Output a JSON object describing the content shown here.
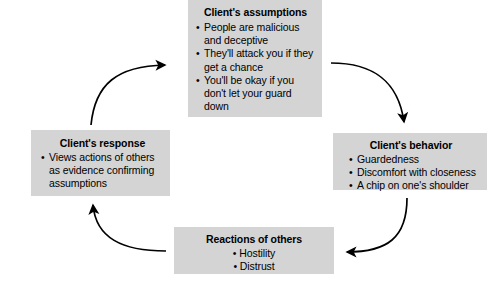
{
  "diagram": {
    "type": "cycle-flowchart",
    "background_color": "#ffffff",
    "box_fill_color": "#d4d4d4",
    "text_color": "#000000",
    "arrow_color": "#000000",
    "nodes": [
      {
        "id": "assumptions",
        "title": "Client's assumptions",
        "items": [
          "People are malicious and deceptive",
          "They'll attack you if they get a chance",
          "You'll be okay if you don't let your guard down"
        ],
        "position": "top"
      },
      {
        "id": "behavior",
        "title": "Client's behavior",
        "items": [
          "Guardedness",
          "Discomfort with closeness",
          "A chip on one's shoulder"
        ],
        "position": "right"
      },
      {
        "id": "reactions",
        "title": "Reactions of others",
        "items": [
          "Hostility",
          "Distrust"
        ],
        "position": "bottom"
      },
      {
        "id": "response",
        "title": "Client's response",
        "items": [
          "Views actions of others as evidence confirming assumptions"
        ],
        "position": "left"
      }
    ],
    "arrows": [
      {
        "id": "assumptions-to-behavior",
        "from": "assumptions",
        "to": "behavior",
        "direction": "clockwise"
      },
      {
        "id": "behavior-to-reactions",
        "from": "behavior",
        "to": "reactions",
        "direction": "clockwise"
      },
      {
        "id": "reactions-to-response",
        "from": "reactions",
        "to": "response",
        "direction": "clockwise"
      },
      {
        "id": "response-to-assumptions",
        "from": "response",
        "to": "assumptions",
        "direction": "clockwise"
      }
    ]
  }
}
